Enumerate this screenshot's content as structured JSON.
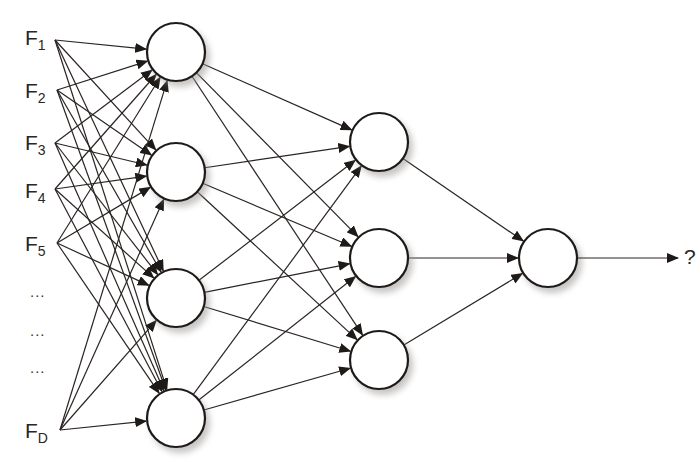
{
  "diagram": {
    "type": "feedforward-neural-network",
    "colors": {
      "line": "#2a2422",
      "node_fill": "#ffffff",
      "node_stroke": "#1e1a18",
      "shadow": "#9a9694",
      "text": "#2a2624"
    },
    "inputs": [
      {
        "id": "F1",
        "main": "F",
        "sub": "1",
        "x": 25,
        "y": 37,
        "anchor_x": 55,
        "anchor_y": 40
      },
      {
        "id": "F2",
        "main": "F",
        "sub": "2",
        "x": 25,
        "y": 90,
        "anchor_x": 57,
        "anchor_y": 90
      },
      {
        "id": "F3",
        "main": "F",
        "sub": "3",
        "x": 25,
        "y": 142,
        "anchor_x": 55,
        "anchor_y": 143
      },
      {
        "id": "F4",
        "main": "F",
        "sub": "4",
        "x": 25,
        "y": 190,
        "anchor_x": 55,
        "anchor_y": 189
      },
      {
        "id": "F5",
        "main": "F",
        "sub": "5",
        "x": 25,
        "y": 243,
        "anchor_x": 57,
        "anchor_y": 243
      },
      {
        "id": "FD",
        "main": "F",
        "sub": "D",
        "x": 25,
        "y": 430,
        "anchor_x": 60,
        "anchor_y": 430
      }
    ],
    "ellipses": [
      {
        "text": "...",
        "x": 30,
        "y": 297
      },
      {
        "text": "...",
        "x": 30,
        "y": 336
      },
      {
        "text": "...",
        "x": 30,
        "y": 373
      }
    ],
    "layers": [
      {
        "name": "hidden-1",
        "nodes": [
          {
            "x": 176,
            "y": 52
          },
          {
            "x": 176,
            "y": 172
          },
          {
            "x": 176,
            "y": 298
          },
          {
            "x": 176,
            "y": 418
          }
        ],
        "r": 29
      },
      {
        "name": "hidden-2",
        "nodes": [
          {
            "x": 379,
            "y": 142
          },
          {
            "x": 379,
            "y": 258
          },
          {
            "x": 379,
            "y": 360
          }
        ],
        "r": 29
      },
      {
        "name": "output",
        "nodes": [
          {
            "x": 548,
            "y": 258
          }
        ],
        "r": 29
      }
    ],
    "output": {
      "label": "?",
      "arrow_end_x": 678,
      "arrow_y": 258,
      "label_x": 684,
      "label_y": 264
    }
  }
}
